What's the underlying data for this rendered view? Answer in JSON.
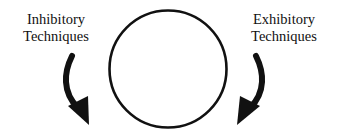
{
  "diagram": {
    "left_label": {
      "line1": "Inhibitory",
      "line2": "Techniques"
    },
    "right_label": {
      "line1": "Exhibitory",
      "line2": "Techniques"
    },
    "center_shape": "circle",
    "arrows": [
      {
        "side": "left",
        "direction": "curved-down-right",
        "icon": "curved-arrow-icon"
      },
      {
        "side": "right",
        "direction": "curved-down-left",
        "icon": "curved-arrow-icon"
      }
    ],
    "colors": {
      "stroke": "#111111",
      "background": "#ffffff"
    }
  }
}
